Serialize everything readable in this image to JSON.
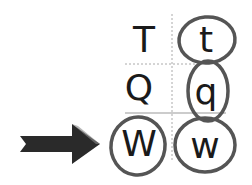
{
  "grid": {
    "rows": [
      {
        "upper": "T",
        "lower": "t"
      },
      {
        "upper": "Q",
        "lower": "q"
      },
      {
        "upper": "W",
        "lower": "w"
      }
    ]
  },
  "marks": {
    "circled": [
      "t",
      "q",
      "W",
      "w"
    ],
    "arrow_target": "W",
    "arrow_icon": "right-arrow-icon"
  },
  "colors": {
    "text": "#1a1a1a",
    "circle_stroke": "#555555",
    "arrow": "#2a2a2a",
    "grid_line": "#aaaaaa"
  }
}
